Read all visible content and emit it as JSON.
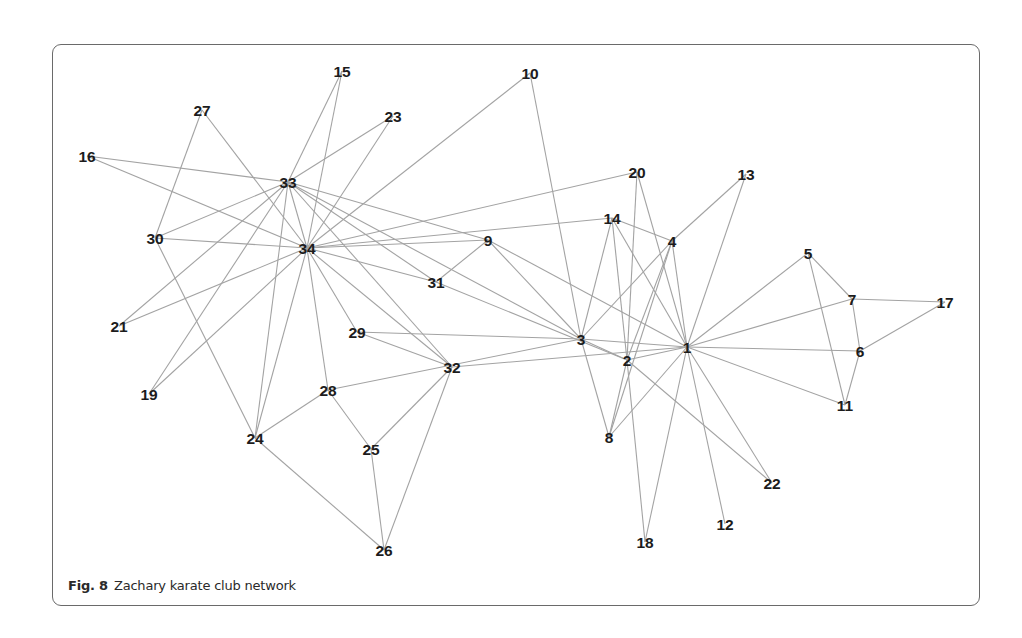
{
  "figure": {
    "caption_label": "Fig. 8",
    "caption_text": "Zachary karate club network"
  },
  "colors": {
    "edge": "#a3a3a3",
    "label": "#1c1c1c",
    "frame": "#6a6a6a"
  },
  "nodes": [
    {
      "id": "1",
      "x": 687,
      "y": 347
    },
    {
      "id": "2",
      "x": 627,
      "y": 360
    },
    {
      "id": "3",
      "x": 581,
      "y": 339
    },
    {
      "id": "4",
      "x": 672,
      "y": 241
    },
    {
      "id": "5",
      "x": 808,
      "y": 253
    },
    {
      "id": "6",
      "x": 860,
      "y": 351
    },
    {
      "id": "7",
      "x": 852,
      "y": 299
    },
    {
      "id": "8",
      "x": 609,
      "y": 437
    },
    {
      "id": "9",
      "x": 488,
      "y": 240
    },
    {
      "id": "10",
      "x": 530,
      "y": 73
    },
    {
      "id": "11",
      "x": 845,
      "y": 405
    },
    {
      "id": "12",
      "x": 725,
      "y": 524
    },
    {
      "id": "13",
      "x": 746,
      "y": 174
    },
    {
      "id": "14",
      "x": 612,
      "y": 218
    },
    {
      "id": "15",
      "x": 342,
      "y": 71
    },
    {
      "id": "16",
      "x": 87,
      "y": 156
    },
    {
      "id": "17",
      "x": 945,
      "y": 302
    },
    {
      "id": "18",
      "x": 645,
      "y": 542
    },
    {
      "id": "19",
      "x": 149,
      "y": 394
    },
    {
      "id": "20",
      "x": 637,
      "y": 172
    },
    {
      "id": "21",
      "x": 119,
      "y": 326
    },
    {
      "id": "22",
      "x": 772,
      "y": 483
    },
    {
      "id": "23",
      "x": 393,
      "y": 116
    },
    {
      "id": "24",
      "x": 255,
      "y": 438
    },
    {
      "id": "25",
      "x": 371,
      "y": 449
    },
    {
      "id": "26",
      "x": 384,
      "y": 550
    },
    {
      "id": "27",
      "x": 202,
      "y": 110
    },
    {
      "id": "28",
      "x": 328,
      "y": 390
    },
    {
      "id": "29",
      "x": 357,
      "y": 332
    },
    {
      "id": "30",
      "x": 155,
      "y": 238
    },
    {
      "id": "31",
      "x": 436,
      "y": 282
    },
    {
      "id": "32",
      "x": 452,
      "y": 367
    },
    {
      "id": "33",
      "x": 288,
      "y": 182
    },
    {
      "id": "34",
      "x": 307,
      "y": 248
    }
  ],
  "edges": [
    [
      "2",
      "1"
    ],
    [
      "3",
      "1"
    ],
    [
      "3",
      "2"
    ],
    [
      "4",
      "1"
    ],
    [
      "4",
      "2"
    ],
    [
      "4",
      "3"
    ],
    [
      "5",
      "1"
    ],
    [
      "6",
      "1"
    ],
    [
      "7",
      "1"
    ],
    [
      "7",
      "5"
    ],
    [
      "7",
      "6"
    ],
    [
      "8",
      "1"
    ],
    [
      "8",
      "2"
    ],
    [
      "8",
      "3"
    ],
    [
      "8",
      "4"
    ],
    [
      "9",
      "1"
    ],
    [
      "9",
      "3"
    ],
    [
      "10",
      "3"
    ],
    [
      "11",
      "1"
    ],
    [
      "11",
      "5"
    ],
    [
      "11",
      "6"
    ],
    [
      "12",
      "1"
    ],
    [
      "13",
      "1"
    ],
    [
      "13",
      "4"
    ],
    [
      "14",
      "1"
    ],
    [
      "14",
      "2"
    ],
    [
      "14",
      "3"
    ],
    [
      "14",
      "4"
    ],
    [
      "17",
      "6"
    ],
    [
      "17",
      "7"
    ],
    [
      "18",
      "1"
    ],
    [
      "18",
      "2"
    ],
    [
      "20",
      "1"
    ],
    [
      "20",
      "2"
    ],
    [
      "22",
      "1"
    ],
    [
      "22",
      "2"
    ],
    [
      "26",
      "24"
    ],
    [
      "26",
      "25"
    ],
    [
      "28",
      "3"
    ],
    [
      "28",
      "24"
    ],
    [
      "28",
      "25"
    ],
    [
      "29",
      "3"
    ],
    [
      "30",
      "24"
    ],
    [
      "30",
      "27"
    ],
    [
      "31",
      "2"
    ],
    [
      "31",
      "9"
    ],
    [
      "32",
      "1"
    ],
    [
      "32",
      "25"
    ],
    [
      "32",
      "26"
    ],
    [
      "32",
      "29"
    ],
    [
      "33",
      "3"
    ],
    [
      "33",
      "9"
    ],
    [
      "33",
      "15"
    ],
    [
      "33",
      "16"
    ],
    [
      "33",
      "19"
    ],
    [
      "33",
      "21"
    ],
    [
      "33",
      "23"
    ],
    [
      "33",
      "24"
    ],
    [
      "33",
      "30"
    ],
    [
      "33",
      "31"
    ],
    [
      "33",
      "32"
    ],
    [
      "34",
      "9"
    ],
    [
      "34",
      "10"
    ],
    [
      "34",
      "14"
    ],
    [
      "34",
      "15"
    ],
    [
      "34",
      "16"
    ],
    [
      "34",
      "19"
    ],
    [
      "34",
      "20"
    ],
    [
      "34",
      "21"
    ],
    [
      "34",
      "23"
    ],
    [
      "34",
      "24"
    ],
    [
      "34",
      "27"
    ],
    [
      "34",
      "28"
    ],
    [
      "34",
      "29"
    ],
    [
      "34",
      "30"
    ],
    [
      "34",
      "31"
    ],
    [
      "34",
      "32"
    ],
    [
      "34",
      "33"
    ]
  ]
}
